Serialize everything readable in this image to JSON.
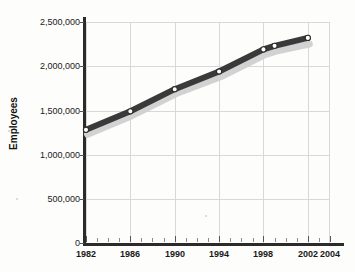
{
  "chart_data": {
    "type": "line",
    "title": "",
    "xlabel": "",
    "ylabel": "Employees",
    "ylim": [
      0,
      2500000
    ],
    "xlim": [
      1982,
      2004
    ],
    "grid": true,
    "legend": "none",
    "x": [
      1982,
      1986,
      1990,
      1994,
      1998,
      1999,
      2002
    ],
    "categories": [
      "1982",
      "1986",
      "1990",
      "1994",
      "1998",
      "1999",
      "2002"
    ],
    "series": [
      {
        "name": "Employees",
        "color": "#3a3a3a",
        "marker": "circle-open",
        "values": [
          1280000,
          1490000,
          1740000,
          1940000,
          2190000,
          2230000,
          2320000
        ]
      },
      {
        "name": "Shadow",
        "color": "#d2d2d2",
        "marker": "none",
        "values": [
          1230000,
          1440000,
          1690000,
          1880000,
          2130000,
          2170000,
          2250000
        ]
      }
    ],
    "y_ticks": [
      0,
      500000,
      1000000,
      1500000,
      2000000,
      2500000
    ],
    "y_tick_labels": [
      "0",
      "500,000",
      "1,000,000",
      "1,500,000",
      "2,000,000",
      "2,500,000"
    ],
    "x_ticks": [
      1982,
      1986,
      1990,
      1994,
      1998,
      2002,
      2004
    ],
    "x_tick_labels": [
      "1982",
      "1986",
      "1990",
      "1994",
      "1998",
      "2002",
      "2004"
    ],
    "x_minor_tick_interval": 1
  },
  "axes": {
    "y_title": "Employees",
    "y_labels": {
      "t0": "0",
      "t1": "500,000",
      "t2": "1,000,000",
      "t3": "1,500,000",
      "t4": "2,000,000",
      "t5": "2,500,000"
    },
    "x_labels": {
      "t0": "1982",
      "t1": "1986",
      "t2": "1990",
      "t3": "1994",
      "t4": "1998",
      "t5": "2002",
      "t6": "2004"
    }
  },
  "title_fragment": " "
}
